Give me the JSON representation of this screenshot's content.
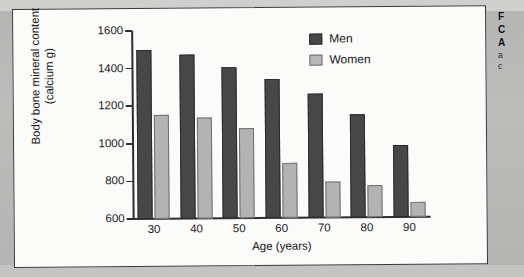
{
  "figure": {
    "panel_name": "figure-panel",
    "background_color": "#b9b9b7",
    "panel_color": "#fbfbfa"
  },
  "caption": {
    "lines": [
      {
        "text": "F",
        "style": "bold"
      },
      {
        "text": "C",
        "style": "bold"
      },
      {
        "text": "A",
        "style": "bold"
      },
      {
        "text": "a",
        "style": "light"
      },
      {
        "text": "c",
        "style": "light"
      }
    ]
  },
  "legend": {
    "entries": [
      {
        "label": "Men",
        "color": "#474747"
      },
      {
        "label": "Women",
        "color": "#b8b8b8"
      }
    ]
  },
  "chart_data": {
    "type": "bar",
    "title": "",
    "xlabel": "Age (years)",
    "ylabel": "Body bone mineral content (calcium g)",
    "ylabel_line1": "Body bone mineral content",
    "ylabel_line2": "(calcium g)",
    "categories": [
      "30",
      "40",
      "50",
      "60",
      "70",
      "80",
      "90"
    ],
    "series": [
      {
        "name": "Men",
        "color": "#474747",
        "values": [
          1500,
          1475,
          1405,
          1340,
          1260,
          1150,
          985
        ]
      },
      {
        "name": "Women",
        "color": "#b3b3b3",
        "values": [
          1155,
          1135,
          1080,
          890,
          790,
          770,
          680
        ]
      }
    ],
    "ylim": [
      600,
      1600
    ],
    "yticks": [
      600,
      800,
      1000,
      1200,
      1400,
      1600
    ],
    "ytick_labels": [
      "600",
      "800",
      "1000",
      "1200",
      "1400",
      "1600"
    ],
    "grid": false,
    "legend_position": "top-right"
  }
}
